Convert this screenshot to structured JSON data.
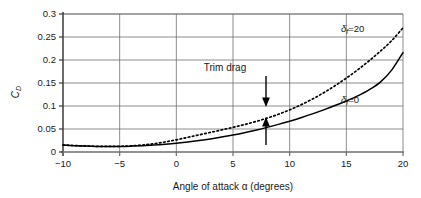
{
  "chart_data": {
    "type": "line",
    "title": "",
    "xlabel": "Angle of attack α (degrees)",
    "ylabel": "C_D",
    "ylabel_main": "C",
    "ylabel_sub": "D",
    "xlim": [
      -10,
      20
    ],
    "ylim": [
      0,
      0.3
    ],
    "grid": true,
    "legend_position": "inline-right",
    "xticks": [
      -10,
      -5,
      0,
      5,
      10,
      15,
      20
    ],
    "xtick_labels": [
      "−10",
      "−5",
      "0",
      "5",
      "10",
      "15",
      "20"
    ],
    "yticks": [
      0,
      0.05,
      0.1,
      0.15,
      0.2,
      0.25,
      0.3
    ],
    "ytick_labels": [
      "0",
      "0.05",
      "0.1",
      "0.15",
      "0.2",
      "0.25",
      "0.3"
    ],
    "x": [
      -10,
      -9,
      -8,
      -7,
      -6,
      -5,
      -4,
      -3,
      -2,
      -1,
      0,
      1,
      2,
      3,
      4,
      5,
      6,
      7,
      8,
      9,
      10,
      11,
      12,
      13,
      14,
      15,
      16,
      17,
      18,
      19,
      20
    ],
    "series": [
      {
        "name": "δf=0",
        "label": "δ",
        "label_sub": "f",
        "label_tail": "=0",
        "style": "solid",
        "color": "#000000",
        "values": [
          0.015,
          0.0138,
          0.0128,
          0.0122,
          0.012,
          0.0121,
          0.0127,
          0.0137,
          0.0151,
          0.0169,
          0.0192,
          0.0219,
          0.025,
          0.0285,
          0.0325,
          0.037,
          0.042,
          0.0475,
          0.0535,
          0.06,
          0.067,
          0.0746,
          0.0828,
          0.0916,
          0.101,
          0.111,
          0.122,
          0.135,
          0.152,
          0.178,
          0.216
        ]
      },
      {
        "name": "δf=20",
        "label": "δ",
        "label_sub": "f",
        "label_tail": "=20",
        "style": "dotted",
        "color": "#000000",
        "values": [
          0.0152,
          0.014,
          0.013,
          0.0124,
          0.0122,
          0.0124,
          0.0134,
          0.0152,
          0.018,
          0.0218,
          0.0265,
          0.0318,
          0.0372,
          0.0426,
          0.048,
          0.0536,
          0.0596,
          0.0662,
          0.0736,
          0.082,
          0.0916,
          0.1026,
          0.115,
          0.1288,
          0.144,
          0.1606,
          0.1786,
          0.198,
          0.219,
          0.242,
          0.27
        ]
      }
    ],
    "annotations": [
      {
        "text": "Trim drag",
        "x": 8.4,
        "arrow_down_to_y": 0.096,
        "arrow_up_from_y": 0.036,
        "arrow_up_to_y": 0.063
      }
    ]
  }
}
